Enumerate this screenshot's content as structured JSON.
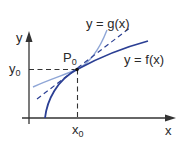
{
  "diagram": {
    "axes": {
      "x_label": "x",
      "y_label": "y"
    },
    "point": {
      "label": "P",
      "sub": "0"
    },
    "ticks": {
      "x0": {
        "label": "x",
        "sub": "0"
      },
      "y0": {
        "label": "y",
        "sub": "0"
      }
    },
    "curves": [
      {
        "name": "f",
        "label": "y = f(x)",
        "color": "#2b3f94"
      },
      {
        "name": "g",
        "label": "y = g(x)",
        "color": "#8fa6d6"
      },
      {
        "name": "tangent",
        "style": "dashed",
        "color": "#2b3f94"
      }
    ]
  }
}
